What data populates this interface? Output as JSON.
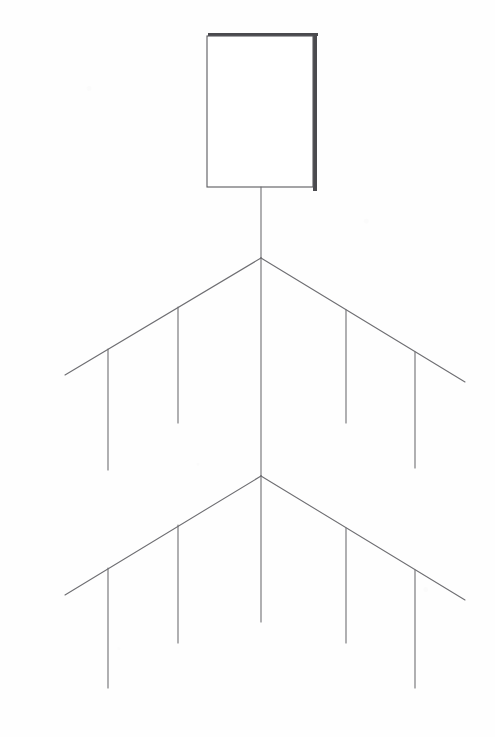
{
  "page": {
    "width": 495,
    "height": 737,
    "background_color": "#fefefe"
  },
  "style": {
    "line_color": "#6e6e72",
    "line_width": 1.1,
    "box_border_color": "#5a5a5e",
    "box_fill_color": "#ffffff",
    "box_shadow_color": "#4a4a4e",
    "shadow_offset_x": 5,
    "shadow_offset_y": 5,
    "shadow_thickness": 4
  },
  "chart_data": {
    "type": "diagram",
    "nodes": [
      {
        "id": "root-box",
        "label": "",
        "shape": "rectangle",
        "x": 207,
        "y": 36,
        "width": 106,
        "height": 151,
        "has_shadow": true
      }
    ],
    "junctions": [
      {
        "id": "junction-1",
        "x": 261,
        "y": 258
      },
      {
        "id": "junction-2",
        "x": 261,
        "y": 476
      }
    ],
    "edges": [
      {
        "id": "root-stem",
        "type": "vertical",
        "x1": 261,
        "y1": 187,
        "x2": 261,
        "y2": 258
      },
      {
        "id": "level1-branch-left",
        "type": "diagonal",
        "x1": 261,
        "y1": 258,
        "x2": 65,
        "y2": 375
      },
      {
        "id": "level1-branch-right",
        "type": "diagonal",
        "x1": 261,
        "y1": 258,
        "x2": 465,
        "y2": 382
      },
      {
        "id": "mid-stem",
        "type": "vertical",
        "x1": 261,
        "y1": 258,
        "x2": 261,
        "y2": 476
      },
      {
        "id": "level2-branch-left",
        "type": "diagonal",
        "x1": 261,
        "y1": 476,
        "x2": 65,
        "y2": 595
      },
      {
        "id": "level2-branch-right",
        "type": "diagonal",
        "x1": 261,
        "y1": 476,
        "x2": 465,
        "y2": 600
      },
      {
        "id": "bottom-stem",
        "type": "vertical",
        "x1": 261,
        "y1": 476,
        "x2": 261,
        "y2": 622
      }
    ],
    "leaf_stubs": [
      {
        "id": "leaf-1-1",
        "level": 1,
        "side": "left",
        "x": 108,
        "y1": 349,
        "y2": 470
      },
      {
        "id": "leaf-1-2",
        "level": 1,
        "side": "left",
        "x": 178,
        "y1": 307,
        "y2": 423
      },
      {
        "id": "leaf-1-3",
        "level": 1,
        "side": "right",
        "x": 346,
        "y1": 310,
        "y2": 423
      },
      {
        "id": "leaf-1-4",
        "level": 1,
        "side": "right",
        "x": 415,
        "y1": 352,
        "y2": 468
      },
      {
        "id": "leaf-2-1",
        "level": 2,
        "side": "left",
        "x": 108,
        "y1": 568,
        "y2": 688
      },
      {
        "id": "leaf-2-2",
        "level": 2,
        "side": "left",
        "x": 178,
        "y1": 525,
        "y2": 643
      },
      {
        "id": "leaf-2-3",
        "level": 2,
        "side": "right",
        "x": 346,
        "y1": 528,
        "y2": 643
      },
      {
        "id": "leaf-2-4",
        "level": 2,
        "side": "right",
        "x": 415,
        "y1": 570,
        "y2": 688
      }
    ],
    "counts": {
      "boxes": 1,
      "levels": 2,
      "branches_per_level": 2,
      "leaf_stubs_per_level": 4,
      "total_leaf_stubs": 8
    }
  }
}
